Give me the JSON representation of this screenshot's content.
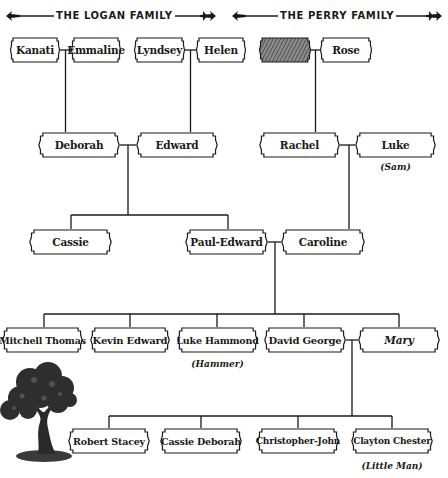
{
  "headers": {
    "logan": "THE LOGAN FAMILY",
    "perry": "THE PERRY FAMILY"
  },
  "generation1": {
    "kanati": "Kanati",
    "emmaline": "Emmaline",
    "lyndsey": "Lyndsey",
    "helen": "Helen",
    "unknown": "",
    "rose": "Rose"
  },
  "generation2": {
    "deborah": "Deborah",
    "edward": "Edward",
    "rachel": "Rachel",
    "luke": "Luke",
    "luke_nickname": "(Sam)"
  },
  "generation3": {
    "cassie": "Cassie",
    "paul_edward": "Paul-Edward",
    "caroline": "Caroline"
  },
  "generation4": {
    "mitchell_thomas": "Mitchell Thomas",
    "kevin_edward": "Kevin Edward",
    "luke_hammond": "Luke Hammond",
    "luke_hammond_nickname": "(Hammer)",
    "david_george": "David George",
    "mary": "Mary"
  },
  "generation5": {
    "robert_stacey": "Robert Stacey",
    "cassie_deborah": "Cassie Deborah",
    "christopher_john": "Christopher-John",
    "clayton_chester": "Clayton Chester",
    "clayton_chester_nickname": "(Little Man)"
  },
  "colors": {
    "line": "#1a1a1a",
    "frame_fill": "#ffffff",
    "frame_shadow": "#9a9a9a",
    "hatch": "#555555"
  }
}
